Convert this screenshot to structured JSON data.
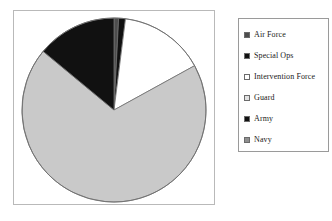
{
  "figure": {
    "background_color": "#ffffff",
    "plot_border_color": "#b9b9b9",
    "legend_border_color": "#9a9a9a"
  },
  "legend": {
    "items": [
      {
        "label": "Air Force",
        "swatch_color": "#4d4d4d",
        "swatch_name": "legend-swatch-air-force"
      },
      {
        "label": "Special Ops",
        "swatch_color": "#111111",
        "swatch_name": "legend-swatch-special-ops"
      },
      {
        "label": "Intervention Force",
        "swatch_color": "#ffffff",
        "swatch_name": "legend-swatch-intervention-force"
      },
      {
        "label": "Guard",
        "swatch_color": "#e2e2e2",
        "swatch_name": "legend-swatch-guard"
      },
      {
        "label": "Army",
        "swatch_color": "#111111",
        "swatch_name": "legend-swatch-army"
      },
      {
        "label": "Navy",
        "swatch_color": "#8f8f8f",
        "swatch_name": "legend-swatch-navy"
      }
    ]
  },
  "chart_data": {
    "type": "pie",
    "title": "",
    "subtitle": "",
    "xlabel": "",
    "ylabel": "",
    "legend_position": "right",
    "grid": false,
    "start_angle_deg": 0,
    "direction": "clockwise",
    "center": {
      "x": 100,
      "y": 99
    },
    "radius": 92,
    "outline_color": "#6f6f6f",
    "categories": [
      "Air Force",
      "Special Ops",
      "Intervention Force",
      "Guard",
      "Navy",
      "Army"
    ],
    "values": [
      0.8,
      1.2,
      15.0,
      69.0,
      0.0,
      14.0
    ],
    "unit": "percent",
    "slices": [
      {
        "label": "Air Force",
        "value": 0.8,
        "color": "#4d4d4d",
        "start_deg": 0.0,
        "end_deg": 2.9
      },
      {
        "label": "Special Ops",
        "value": 1.2,
        "color": "#111111",
        "start_deg": 2.9,
        "end_deg": 7.2
      },
      {
        "label": "Intervention Force",
        "value": 15.0,
        "color": "#ffffff",
        "start_deg": 7.2,
        "end_deg": 61.2
      },
      {
        "label": "Guard",
        "value": 69.0,
        "color": "#c9c9c9",
        "start_deg": 61.2,
        "end_deg": 309.6
      },
      {
        "label": "Navy",
        "value": 0.0,
        "color": "#8f8f8f",
        "start_deg": 309.6,
        "end_deg": 309.6
      },
      {
        "label": "Army",
        "value": 14.0,
        "color": "#111111",
        "start_deg": 309.6,
        "end_deg": 360.0
      }
    ]
  }
}
